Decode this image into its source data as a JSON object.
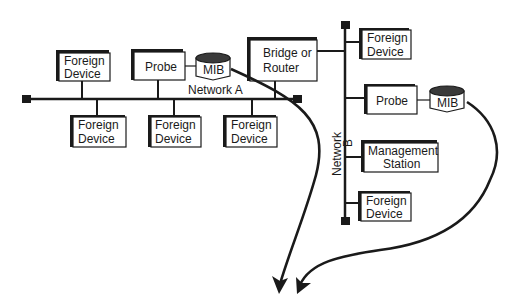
{
  "diagram": {
    "networks": {
      "a": {
        "label": "Network A"
      },
      "b": {
        "label_1": "Network",
        "label_2": "B"
      }
    },
    "nodes": {
      "fd_a_top": {
        "line1": "Foreign",
        "line2": "Device"
      },
      "probe_a": {
        "label": "Probe"
      },
      "mib_a": {
        "label": "MIB"
      },
      "bridge": {
        "line1": "Bridge or",
        "line2": "Router"
      },
      "fd_a_bot1": {
        "line1": "Foreign",
        "line2": "Device"
      },
      "fd_a_bot2": {
        "line1": "Foreign",
        "line2": "Device"
      },
      "fd_a_bot3": {
        "line1": "Foreign",
        "line2": "Device"
      },
      "fd_b_top": {
        "line1": "Foreign",
        "line2": "Device"
      },
      "probe_b": {
        "label": "Probe"
      },
      "mib_b": {
        "label": "MIB"
      },
      "mgmt": {
        "line1": "Management",
        "line2": "Station"
      },
      "fd_b_bot": {
        "line1": "Foreign",
        "line2": "Device"
      }
    },
    "colors": {
      "ink": "#1a1a1a",
      "background": "#ffffff"
    }
  }
}
